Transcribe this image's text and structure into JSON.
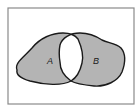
{
  "diagram": {
    "type": "venn",
    "operation": "symmetric-difference",
    "sets": [
      {
        "id": "A",
        "label": "A",
        "shaded": true
      },
      {
        "id": "B",
        "label": "B",
        "shaded": true
      }
    ],
    "intersection": {
      "label": "",
      "shaded": false
    },
    "colors": {
      "frame": "#8a8a8a",
      "shade": "#b4b4b4",
      "outline": "#1a1a1a",
      "background": "#ffffff",
      "intersection_fill": "#ffffff"
    }
  }
}
